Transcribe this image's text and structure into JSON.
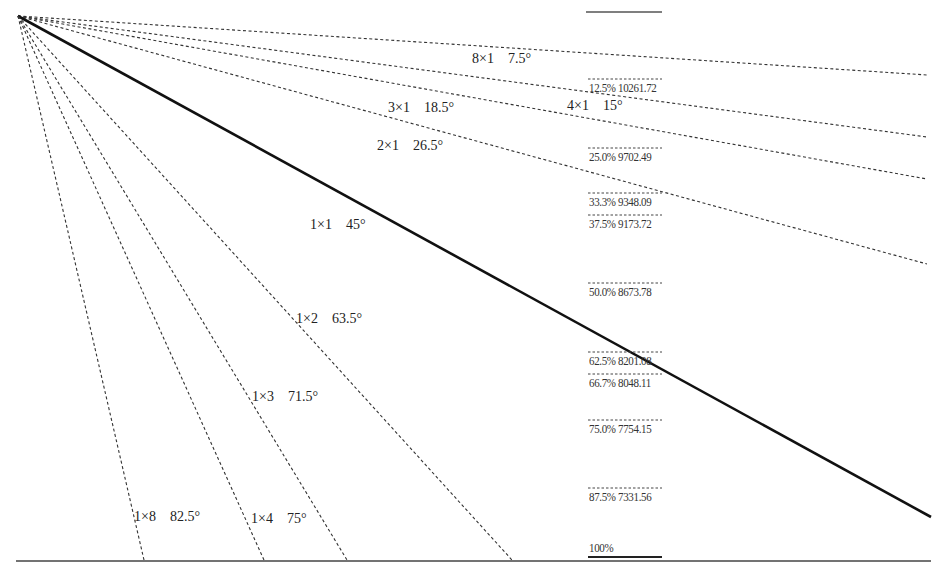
{
  "chart_data": {
    "type": "line",
    "title": "",
    "origin": [
      18,
      16
    ],
    "gann_lines": [
      {
        "ratio": "8×1",
        "angle": "7.5°",
        "end": [
          927,
          75
        ],
        "style": "dashed",
        "label_pos": [
          472,
          52
        ]
      },
      {
        "ratio": "4×1",
        "angle": "15°",
        "end": [
          927,
          137
        ],
        "style": "dashed",
        "label_pos": [
          567,
          99
        ]
      },
      {
        "ratio": "3×1",
        "angle": "18.5°",
        "end": [
          927,
          179
        ],
        "style": "dashed",
        "label_pos": [
          388,
          101
        ]
      },
      {
        "ratio": "2×1",
        "angle": "26.5°",
        "end": [
          927,
          264
        ],
        "style": "dashed",
        "label_pos": [
          377,
          139
        ]
      },
      {
        "ratio": "1×1",
        "angle": "45°",
        "end": [
          931,
          517
        ],
        "style": "solid",
        "label_pos": [
          310,
          218
        ]
      },
      {
        "ratio": "1×2",
        "angle": "63.5°",
        "end": [
          512,
          560
        ],
        "style": "dashed",
        "label_pos": [
          296,
          312
        ]
      },
      {
        "ratio": "1×3",
        "angle": "71.5°",
        "end": [
          347,
          560
        ],
        "style": "dashed",
        "label_pos": [
          252,
          390
        ]
      },
      {
        "ratio": "1×4",
        "angle": "75°",
        "end": [
          264,
          560
        ],
        "style": "dashed",
        "label_pos": [
          251,
          512
        ]
      },
      {
        "ratio": "1×8",
        "angle": "82.5°",
        "end": [
          144,
          560
        ],
        "style": "dashed",
        "label_pos": [
          134,
          510
        ]
      }
    ],
    "fib_levels": [
      {
        "pct": "12.5%",
        "price": "10261.72",
        "y": 79
      },
      {
        "pct": "25.0%",
        "price": "9702.49",
        "y": 148
      },
      {
        "pct": "33.3%",
        "price": "9348.09",
        "y": 193
      },
      {
        "pct": "37.5%",
        "price": "9173.72",
        "y": 215
      },
      {
        "pct": "50.0%",
        "price": "8673.78",
        "y": 283
      },
      {
        "pct": "62.5%",
        "price": "8201.08",
        "y": 352
      },
      {
        "pct": "66.7%",
        "price": "8048.11",
        "y": 374
      },
      {
        "pct": "75.0%",
        "price": "7754.15",
        "y": 420
      },
      {
        "pct": "87.5%",
        "price": "7331.56",
        "y": 488
      },
      {
        "pct": "100%",
        "price": "",
        "y": 557
      }
    ],
    "top_level_line": {
      "x1": 586,
      "x2": 662,
      "y": 12
    },
    "baseline": {
      "x1": 16,
      "x2": 931,
      "y": 561
    },
    "fib_column_x": [
      588,
      662
    ],
    "grid": false,
    "legend": "none"
  }
}
